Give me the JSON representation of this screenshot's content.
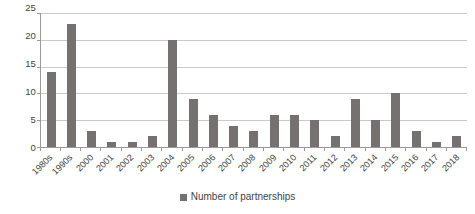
{
  "chart_data": {
    "type": "bar",
    "title": "",
    "subtitle": "",
    "xlabel": "",
    "ylabel": "",
    "ylim": [
      0,
      25
    ],
    "ytick_step": 5,
    "yticks": [
      25,
      20,
      15,
      10,
      5,
      0
    ],
    "grid": "horizontal",
    "legend_position": "bottom",
    "series": [
      {
        "name": "Number of partnerships",
        "color": "#767171",
        "values": [
          14,
          23,
          3,
          1,
          1,
          2,
          20,
          9,
          6,
          4,
          3,
          6,
          6,
          5,
          2,
          9,
          5,
          10,
          3,
          1,
          2
        ]
      }
    ],
    "categories": [
      "1980s",
      "1990s",
      "2000",
      "2001",
      "2002",
      "2003",
      "2004",
      "2005",
      "2006",
      "2007",
      "2008",
      "2009",
      "2010",
      "2011",
      "2012",
      "2013",
      "2014",
      "2015",
      "2016",
      "2017",
      "2018"
    ]
  },
  "legend": {
    "items": [
      {
        "label": "Number of partnerships",
        "color": "#767171"
      }
    ]
  },
  "colors": {
    "bar": "#767171",
    "gridline": "#c9c9c9",
    "axis": "#9a9a9a",
    "text": "#3f3f3f",
    "background": "#ffffff"
  }
}
